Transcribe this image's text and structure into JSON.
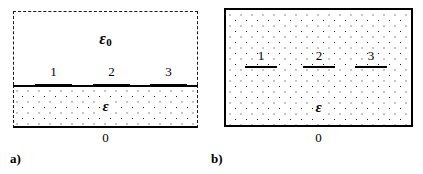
{
  "figure": {
    "panels": [
      {
        "caption": "a)",
        "outer_region_label": "ε",
        "outer_region_subscript": "0",
        "inner_region_label": "ε",
        "ground_label": "0",
        "boundary_style": "dashed",
        "electrodes": [
          {
            "number": "1"
          },
          {
            "number": "2"
          },
          {
            "number": "3"
          }
        ]
      },
      {
        "caption": "b)",
        "inner_region_label": "ε",
        "ground_label": "0",
        "boundary_style": "solid",
        "electrodes": [
          {
            "number": "1"
          },
          {
            "number": "2"
          },
          {
            "number": "3"
          }
        ]
      }
    ],
    "colors": {
      "line": "#000000",
      "dot": "#1c1c1c",
      "background": "#ffffff"
    }
  }
}
